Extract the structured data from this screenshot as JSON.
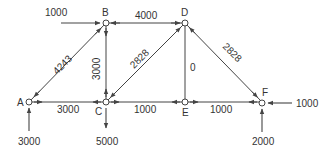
{
  "diagram": {
    "type": "truss",
    "nodes": [
      {
        "id": "A",
        "label": "A",
        "x": 29,
        "y": 102
      },
      {
        "id": "B",
        "label": "B",
        "x": 106,
        "y": 23
      },
      {
        "id": "C",
        "label": "C",
        "x": 106,
        "y": 102
      },
      {
        "id": "D",
        "label": "D",
        "x": 185,
        "y": 23
      },
      {
        "id": "E",
        "label": "E",
        "x": 185,
        "y": 102
      },
      {
        "id": "F",
        "label": "F",
        "x": 262,
        "y": 102
      }
    ],
    "members": [
      {
        "from": "A",
        "to": "B",
        "force": "4243"
      },
      {
        "from": "A",
        "to": "C",
        "force": "3000"
      },
      {
        "from": "B",
        "to": "C",
        "force": "3000"
      },
      {
        "from": "B",
        "to": "D",
        "force": "4000"
      },
      {
        "from": "C",
        "to": "D",
        "force": "2828"
      },
      {
        "from": "C",
        "to": "E",
        "force": "1000"
      },
      {
        "from": "D",
        "to": "E",
        "force": "0"
      },
      {
        "from": "D",
        "to": "F",
        "force": "2828"
      },
      {
        "from": "E",
        "to": "F",
        "force": "1000"
      }
    ],
    "external_loads": [
      {
        "node": "B",
        "value": "1000",
        "direction": "right"
      },
      {
        "node": "A",
        "value": "3000",
        "direction": "up"
      },
      {
        "node": "C",
        "value": "5000",
        "direction": "down"
      },
      {
        "node": "F",
        "value": "1000",
        "direction": "left"
      },
      {
        "node": "F",
        "value": "2000",
        "direction": "up"
      }
    ],
    "colors": {
      "line": "#444444",
      "text": "#333333",
      "background": "#ffffff"
    }
  }
}
